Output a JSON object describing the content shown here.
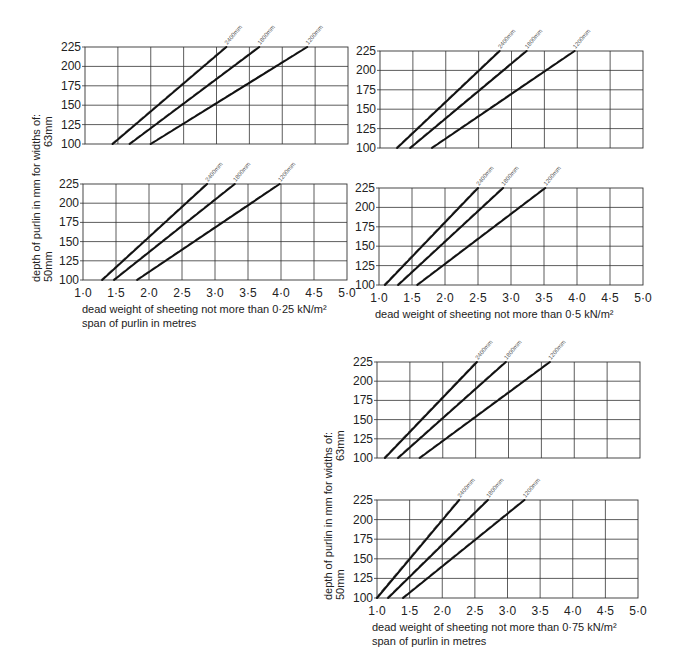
{
  "figure": {
    "y_axis_title_line1": "depth of purlin in mm for widths of:",
    "y_axis_title_63": "63mm",
    "y_axis_title_50": "50mm",
    "x_axis_title": "span of purlin in metres",
    "x_ticks": [
      "1·0",
      "1·5",
      "2·0",
      "2·5",
      "3·0",
      "3·5",
      "4·0",
      "4·5",
      "5·0"
    ],
    "y_ticks": [
      "225",
      "200",
      "175",
      "150",
      "125",
      "100"
    ],
    "captions": {
      "load_025": "dead weight of sheeting not more than 0·25 kN/m²",
      "load_05": "dead weight of sheeting not more than 0·5 kN/m²",
      "load_075": "dead weight of sheeting not more than 0·75 kN/m²"
    },
    "series_names": [
      "2400mm",
      "1800mm",
      "1200mm"
    ]
  },
  "chart_data": [
    {
      "type": "line",
      "title": "dead weight of sheeting not more than 0·25 kN/m² — 63mm width",
      "xlabel": "span of purlin in metres",
      "ylabel": "depth of purlin in mm (63mm width)",
      "xlim": [
        1.0,
        5.0
      ],
      "ylim": [
        100,
        225
      ],
      "grid": true,
      "series": [
        {
          "name": "2400mm",
          "x": [
            1.42,
            3.15
          ],
          "y": [
            100,
            225
          ]
        },
        {
          "name": "1800mm",
          "x": [
            1.68,
            3.65
          ],
          "y": [
            100,
            225
          ]
        },
        {
          "name": "1200mm",
          "x": [
            2.0,
            4.38
          ],
          "y": [
            100,
            225
          ]
        }
      ]
    },
    {
      "type": "line",
      "title": "dead weight of sheeting not more than 0·25 kN/m² — 50mm width",
      "xlabel": "span of purlin in metres",
      "ylabel": "depth of purlin in mm (50mm width)",
      "xlim": [
        1.0,
        5.0
      ],
      "ylim": [
        100,
        225
      ],
      "grid": true,
      "series": [
        {
          "name": "2400mm",
          "x": [
            1.29,
            2.88
          ],
          "y": [
            100,
            225
          ]
        },
        {
          "name": "1800mm",
          "x": [
            1.47,
            3.3
          ],
          "y": [
            100,
            225
          ]
        },
        {
          "name": "1200mm",
          "x": [
            1.82,
            3.98
          ],
          "y": [
            100,
            225
          ]
        }
      ]
    },
    {
      "type": "line",
      "title": "dead weight of sheeting not more than 0·5 kN/m² — 63mm width",
      "xlabel": "span of purlin in metres",
      "ylabel": "depth of purlin in mm (63mm width)",
      "xlim": [
        1.0,
        5.0
      ],
      "ylim": [
        100,
        225
      ],
      "grid": true,
      "series": [
        {
          "name": "2400mm",
          "x": [
            1.26,
            2.82
          ],
          "y": [
            100,
            225
          ]
        },
        {
          "name": "1800mm",
          "x": [
            1.46,
            3.23
          ],
          "y": [
            100,
            225
          ]
        },
        {
          "name": "1200mm",
          "x": [
            1.79,
            3.96
          ],
          "y": [
            100,
            225
          ]
        }
      ]
    },
    {
      "type": "line",
      "title": "dead weight of sheeting not more than 0·5 kN/m² — 50mm width",
      "xlabel": "span of purlin in metres",
      "ylabel": "depth of purlin in mm (50mm width)",
      "xlim": [
        1.0,
        5.0
      ],
      "ylim": [
        100,
        225
      ],
      "grid": true,
      "series": [
        {
          "name": "2400mm",
          "x": [
            1.09,
            2.5
          ],
          "y": [
            100,
            225
          ]
        },
        {
          "name": "1800mm",
          "x": [
            1.29,
            2.88
          ],
          "y": [
            100,
            225
          ]
        },
        {
          "name": "1200mm",
          "x": [
            1.58,
            3.52
          ],
          "y": [
            100,
            225
          ]
        }
      ]
    },
    {
      "type": "line",
      "title": "dead weight of sheeting not more than 0·75 kN/m² — 63mm width",
      "xlabel": "span of purlin in metres",
      "ylabel": "depth of purlin in mm (63mm width)",
      "xlim": [
        1.0,
        5.0
      ],
      "ylim": [
        100,
        225
      ],
      "grid": true,
      "series": [
        {
          "name": "2400mm",
          "x": [
            1.12,
            2.52
          ],
          "y": [
            100,
            225
          ]
        },
        {
          "name": "1800mm",
          "x": [
            1.32,
            2.96
          ],
          "y": [
            100,
            225
          ]
        },
        {
          "name": "1200mm",
          "x": [
            1.65,
            3.63
          ],
          "y": [
            100,
            225
          ]
        }
      ]
    },
    {
      "type": "line",
      "title": "dead weight of sheeting not more than 0·75 kN/m² — 50mm width",
      "xlabel": "span of purlin in metres",
      "ylabel": "depth of purlin in mm (50mm width)",
      "xlim": [
        1.0,
        5.0
      ],
      "ylim": [
        100,
        225
      ],
      "grid": true,
      "series": [
        {
          "name": "2400mm",
          "x": [
            1.0,
            2.26
          ],
          "y": [
            100,
            225
          ]
        },
        {
          "name": "1800mm",
          "x": [
            1.17,
            2.7
          ],
          "y": [
            100,
            225
          ]
        },
        {
          "name": "1200mm",
          "x": [
            1.4,
            3.26
          ],
          "y": [
            100,
            225
          ]
        }
      ]
    }
  ]
}
